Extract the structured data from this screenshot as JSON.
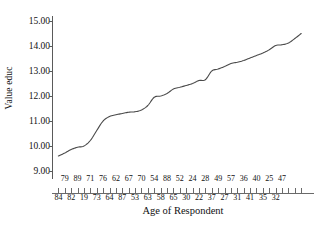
{
  "chart_data": {
    "type": "line",
    "title": "",
    "xlabel": "Age of Respondent",
    "ylabel": "Value educ",
    "ylim": [
      9.0,
      15.0
    ],
    "yticks": [
      9.0,
      10.0,
      11.0,
      12.0,
      13.0,
      14.0,
      15.0
    ],
    "ytick_labels": [
      "9.00",
      "10.00",
      "11.00",
      "12.00",
      "13.00",
      "14.00",
      "15.00"
    ],
    "grid": false,
    "legend": "none",
    "line_color": "#4a4a4a",
    "background": "#ffffff",
    "xtick_labels_top": [
      "79",
      "89",
      "71",
      "76",
      "62",
      "67",
      "70",
      "54",
      "88",
      "52",
      "24",
      "28",
      "49",
      "57",
      "36",
      "40",
      "25",
      "47"
    ],
    "xtick_labels_bottom": [
      "84",
      "82",
      "19",
      "73",
      "64",
      "87",
      "53",
      "63",
      "58",
      "65",
      "30",
      "22",
      "37",
      "27",
      "31",
      "41",
      "35",
      "32"
    ],
    "categories": [
      "84",
      "79",
      "82",
      "89",
      "19",
      "71",
      "73",
      "76",
      "64",
      "62",
      "87",
      "67",
      "53",
      "70",
      "63",
      "54",
      "58",
      "88",
      "65",
      "52",
      "30",
      "24",
      "22",
      "28",
      "37",
      "49",
      "27",
      "57",
      "31",
      "36",
      "41",
      "40",
      "35",
      "25",
      "32",
      "47"
    ],
    "values": [
      9.6,
      9.72,
      9.86,
      9.95,
      10.0,
      10.22,
      10.62,
      11.0,
      11.18,
      11.25,
      11.3,
      11.35,
      11.37,
      11.44,
      11.62,
      11.95,
      12.0,
      12.1,
      12.28,
      12.35,
      12.42,
      12.5,
      12.62,
      12.65,
      13.0,
      13.08,
      13.18,
      13.3,
      13.35,
      13.42,
      13.52,
      13.62,
      13.72,
      13.85,
      14.02,
      14.05
    ],
    "values_extra": [
      14.12,
      14.3,
      14.5
    ],
    "y_start": 9.6,
    "y_end": 14.5,
    "n_ticks": 36
  },
  "axis": {
    "y_title": "Value educ",
    "x_title": "Age of Respondent"
  }
}
